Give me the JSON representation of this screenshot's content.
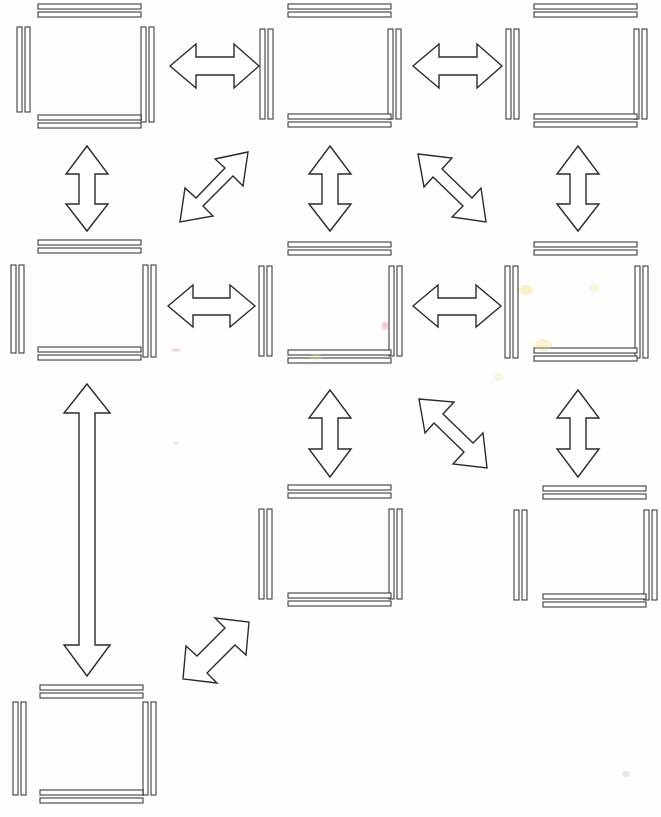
{
  "figure": {
    "kind": "node-link-diagram",
    "canvas": {
      "width": 661,
      "height": 817
    },
    "background_color": "#fdfdfc",
    "ink_color": "#2b2b2b",
    "node_fill": "#ffffff",
    "node_style": "square outline drawn as four pairs of parallel double bars with open corners",
    "arrow_style": "hollow outlined double-headed arrow"
  },
  "chart_data": {
    "type": "diagram",
    "title": "",
    "node_count": 7,
    "edge_count": 11,
    "grid": {
      "columns": 3,
      "rows": 4
    },
    "nodes": [
      {
        "id": "n1",
        "label": "",
        "grid": {
          "col": 1,
          "row": 1
        },
        "box": {
          "x": 17,
          "y": 4,
          "w": 139,
          "h": 126
        }
      },
      {
        "id": "n2",
        "label": "",
        "grid": {
          "col": 2,
          "row": 1
        },
        "box": {
          "x": 255,
          "y": 4,
          "w": 139,
          "h": 126
        }
      },
      {
        "id": "n3",
        "label": "",
        "grid": {
          "col": 3,
          "row": 1
        },
        "box": {
          "x": 504,
          "y": 4,
          "w": 139,
          "h": 126
        }
      },
      {
        "id": "n4",
        "label": "",
        "grid": {
          "col": 1,
          "row": 2
        },
        "box": {
          "x": 8,
          "y": 238,
          "w": 139,
          "h": 126
        }
      },
      {
        "id": "n5",
        "label": "",
        "grid": {
          "col": 2,
          "row": 2
        },
        "box": {
          "x": 255,
          "y": 238,
          "w": 139,
          "h": 126
        }
      },
      {
        "id": "n6",
        "label": "",
        "grid": {
          "col": 3,
          "row": 2
        },
        "box": {
          "x": 504,
          "y": 238,
          "w": 139,
          "h": 126
        }
      },
      {
        "id": "n7",
        "label": "",
        "grid": {
          "col": 2,
          "row": 3
        },
        "box": {
          "x": 255,
          "y": 482,
          "w": 139,
          "h": 126
        }
      },
      {
        "id": "n8",
        "label": "",
        "grid": {
          "col": 3,
          "row": 3
        },
        "box": {
          "x": 513,
          "y": 482,
          "w": 139,
          "h": 126
        }
      },
      {
        "id": "n9",
        "label": "",
        "grid": {
          "col": 1,
          "row": 4
        },
        "box": {
          "x": 8,
          "y": 682,
          "w": 139,
          "h": 126
        }
      }
    ],
    "edges": [
      {
        "from": "n1",
        "to": "n2",
        "orientation": "horizontal",
        "arrowheads": "both"
      },
      {
        "from": "n2",
        "to": "n3",
        "orientation": "horizontal",
        "arrowheads": "both"
      },
      {
        "from": "n1",
        "to": "n4",
        "orientation": "vertical",
        "arrowheads": "both"
      },
      {
        "from": "n2",
        "to": "n5",
        "orientation": "vertical",
        "arrowheads": "both"
      },
      {
        "from": "n3",
        "to": "n6",
        "orientation": "vertical",
        "arrowheads": "both"
      },
      {
        "from": "n1",
        "to": "n5",
        "orientation": "diagonal-ne-sw",
        "arrowheads": "both"
      },
      {
        "from": "n3",
        "to": "n5",
        "orientation": "diagonal-nw-se",
        "arrowheads": "both"
      },
      {
        "from": "n4",
        "to": "n5",
        "orientation": "horizontal",
        "arrowheads": "both"
      },
      {
        "from": "n5",
        "to": "n6",
        "orientation": "horizontal",
        "arrowheads": "both"
      },
      {
        "from": "n5",
        "to": "n7",
        "orientation": "vertical",
        "arrowheads": "both"
      },
      {
        "from": "n6",
        "to": "n8",
        "orientation": "vertical",
        "arrowheads": "both"
      },
      {
        "from": "n6",
        "to": "n7",
        "orientation": "diagonal-nw-se",
        "arrowheads": "both"
      },
      {
        "from": "n4",
        "to": "n9",
        "orientation": "vertical-long",
        "arrowheads": "both"
      },
      {
        "from": "n9",
        "to": "n7",
        "orientation": "diagonal-ne-sw",
        "arrowheads": "both"
      }
    ]
  }
}
